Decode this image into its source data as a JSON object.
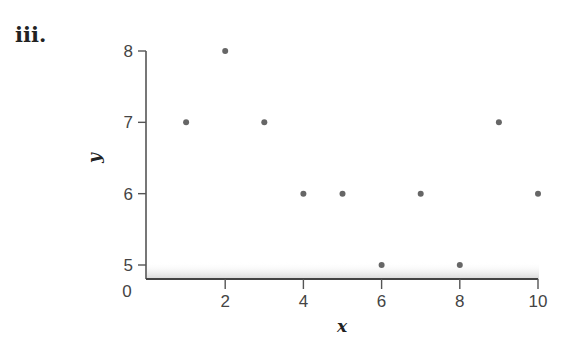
{
  "panel_label": "iii.",
  "chart_data": {
    "type": "scatter",
    "title": "",
    "xlabel": "x",
    "ylabel": "y",
    "x": [
      1,
      2,
      3,
      4,
      5,
      6,
      7,
      8,
      9,
      10
    ],
    "y": [
      7,
      8,
      7,
      6,
      6,
      5,
      6,
      5,
      7,
      6
    ],
    "xlim": [
      0,
      10
    ],
    "ylim": [
      5,
      8
    ],
    "x_ticks": [
      2,
      4,
      6,
      8,
      10
    ],
    "y_ticks": [
      5,
      6,
      7,
      8
    ],
    "origin_label": "0",
    "y_axis_break": true,
    "grid": false,
    "legend": null,
    "marker_color": "#666666"
  }
}
